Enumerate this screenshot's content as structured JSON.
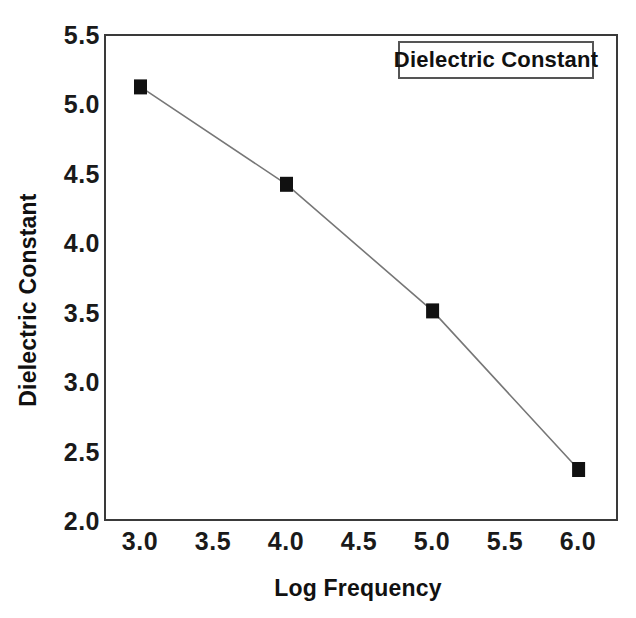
{
  "chart_data": {
    "type": "line",
    "title": "",
    "xlabel": "Log Frequency",
    "ylabel": "Dielectric Constant",
    "xlim": [
      2.75,
      6.27
    ],
    "ylim": [
      2.0,
      5.5
    ],
    "xticks": [
      "3.0",
      "3.5",
      "4.0",
      "4.5",
      "5.0",
      "5.5",
      "6.0"
    ],
    "xtick_values": [
      3.0,
      3.5,
      4.0,
      4.5,
      5.0,
      5.5,
      6.0
    ],
    "yticks": [
      "5.5",
      "5.0",
      "4.5",
      "4.0",
      "3.5",
      "3.0",
      "2.5",
      "2.0"
    ],
    "ytick_values": [
      5.5,
      5.0,
      4.5,
      4.0,
      3.5,
      3.0,
      2.5,
      2.0
    ],
    "grid": false,
    "legend_position": "top-right",
    "legend_entries": [
      "Dielectric Constant"
    ],
    "series": [
      {
        "name": "Dielectric Constant",
        "marker": "filled-square",
        "marker_color": "#111111",
        "line_color": "#777777",
        "x": [
          3.0,
          4.0,
          5.0,
          6.0
        ],
        "values": [
          5.12,
          4.42,
          3.51,
          2.37
        ]
      }
    ]
  },
  "legend": {
    "label": "Dielectric Constant"
  },
  "axes": {
    "x_title": "Log Frequency",
    "y_title": "Dielectric Constant"
  }
}
